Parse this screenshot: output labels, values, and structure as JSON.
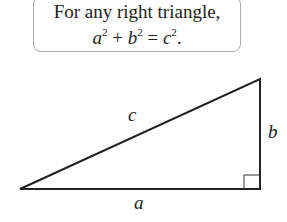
{
  "statement": {
    "line1": "For any right triangle,",
    "equation": {
      "a": "a",
      "b": "b",
      "c": "c",
      "exp": "2",
      "plus": "+",
      "equals": "=",
      "period": "."
    }
  },
  "triangle": {
    "labels": {
      "hypotenuse": "c",
      "vertical_leg": "b",
      "horizontal_leg": "a"
    },
    "right_angle_marker": true
  }
}
